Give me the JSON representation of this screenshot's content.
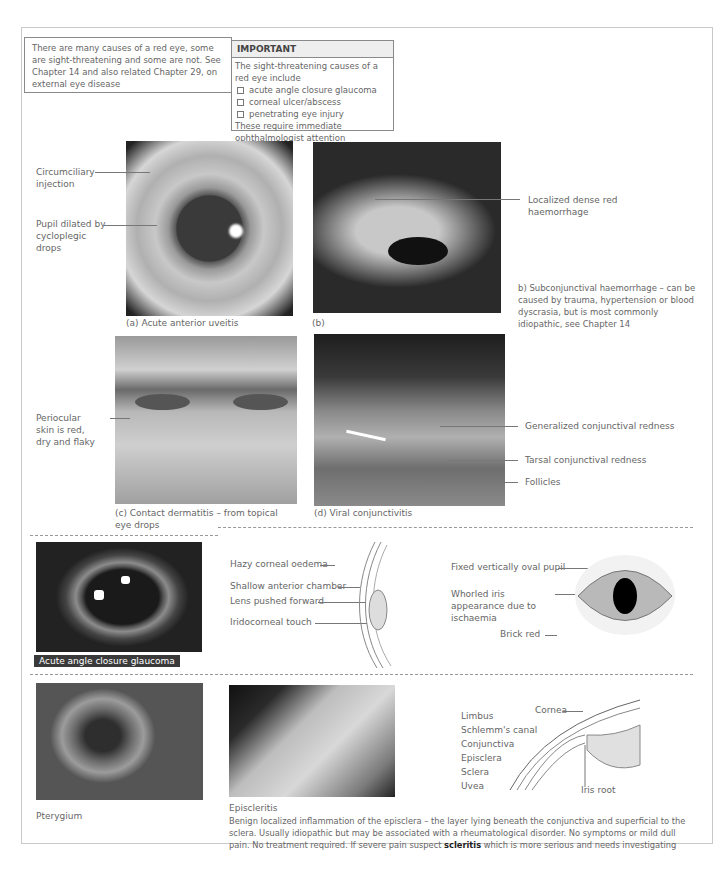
{
  "intro": {
    "text": "There are many causes of a red eye, some are sight-threatening and some are not.  See Chapter 14 and also related Chapter 29, on external eye disease"
  },
  "important": {
    "title": "IMPORTANT",
    "lead": "The sight-threatening causes of a red eye include",
    "items": [
      "acute angle closure glaucoma",
      "corneal ulcer/abscess",
      "penetrating eye injury"
    ],
    "footer": "These require immediate ophthalmologist attention"
  },
  "figure_a": {
    "caption": "(a)  Acute anterior uveitis",
    "labels": [
      "Circumciliary injection",
      "Pupil dilated by cycloplegic drops"
    ]
  },
  "figure_b": {
    "caption": "(b)",
    "labels": [
      "Localized dense red haemorrhage"
    ],
    "description": "b) Subconjunctival haemorrhage – can be caused by trauma, hypertension or blood dyscrasia, but is most commonly idiopathic, see Chapter 14"
  },
  "figure_c": {
    "caption": "(c) Contact dermatitis – from topical eye drops",
    "labels": [
      "Periocular skin is red, dry and flaky"
    ]
  },
  "figure_d": {
    "caption": "(d) Viral conjunctivitis",
    "labels": [
      "Generalized conjunctival redness",
      "Tarsal conjunctival redness",
      "Follicles"
    ]
  },
  "glaucoma": {
    "caption": "Acute angle closure glaucoma",
    "side_labels": [
      "Hazy corneal oedema",
      "Shallow anterior chamber",
      "Lens pushed forward",
      "Iridocorneal touch"
    ],
    "front_labels": [
      "Fixed vertically oval pupil",
      "Whorled iris appearance due to ischaemia",
      "Brick red"
    ]
  },
  "pterygium": {
    "caption": "Pterygium"
  },
  "episcleritis": {
    "caption": "Episcleritis",
    "desc_pre": "Benign localized inflammation of the episclera – the layer lying beneath the conjunctiva and superficial to the sclera. Usually idiopathic but may be associated with a rheumatological disorder. No symptoms or mild dull pain. No treatment required. If severe pain suspect ",
    "desc_bold": "scleritis",
    "desc_post": " which is more serious and needs investigating"
  },
  "anatomy": {
    "left_labels": [
      "Limbus",
      "Schlemm's canal",
      "Conjunctiva",
      "Episclera",
      "Sclera",
      "Uvea"
    ],
    "top_label": "Cornea",
    "bottom_label": "Iris root"
  },
  "colors": {
    "caption_bg": "#3a3a3a",
    "text": "#666666",
    "border": "#8a8a8a"
  }
}
